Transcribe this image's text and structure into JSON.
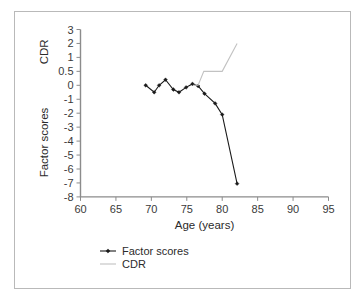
{
  "figure": {
    "border_color": "#b9b9b9",
    "background": "#ffffff"
  },
  "chart_data": {
    "type": "line",
    "title": "",
    "xlabel": "Age (years)",
    "ylabel_upper": "CDR",
    "ylabel_lower": "Factor scores",
    "grid": false,
    "legend_position": "bottom-left",
    "xlim": [
      60,
      95
    ],
    "xticks": [
      60,
      65,
      70,
      75,
      80,
      85,
      90,
      95
    ],
    "xtick_labels": [
      "60",
      "65",
      "70",
      "75",
      "80",
      "85",
      "90",
      "95"
    ],
    "ytick_labels": [
      "3",
      "2",
      "1",
      "0.5",
      "0",
      "-1",
      "-2",
      "-3",
      "-4",
      "-5",
      "-6",
      "-7",
      "-8"
    ],
    "ytick_values": [
      3,
      2,
      1,
      0.5,
      0,
      -1,
      -2,
      -3,
      -4,
      -5,
      -6,
      -7,
      -8
    ],
    "y_axis_note": "evenly spaced categorical ticks (non-linear: 0.5 inserted between 1 and 0)",
    "series": [
      {
        "name": "Factor scores",
        "color": "#1a1a1a",
        "marker": "diamond",
        "width": 1.1,
        "x": [
          69.2,
          70.4,
          71.1,
          72.0,
          73.1,
          73.9,
          74.9,
          75.8,
          76.6,
          77.5,
          79.0,
          80.0,
          82.1
        ],
        "y": [
          0.0,
          -0.5,
          0.0,
          0.2,
          -0.3,
          -0.5,
          -0.15,
          0.05,
          -0.05,
          -0.6,
          -1.3,
          -2.1,
          -7.05
        ]
      },
      {
        "name": "CDR",
        "color": "#c2c2c2",
        "marker": "none",
        "width": 1.1,
        "x": [
          75.9,
          76.6,
          77.4,
          80.0,
          82.1
        ],
        "y": [
          0.0,
          0.0,
          0.5,
          0.5,
          2.0
        ]
      }
    ]
  },
  "legend": {
    "items": [
      {
        "label": "Factor scores",
        "color": "#1a1a1a",
        "marker": "diamond"
      },
      {
        "label": "CDR",
        "color": "#c2c2c2",
        "marker": "none"
      }
    ]
  }
}
